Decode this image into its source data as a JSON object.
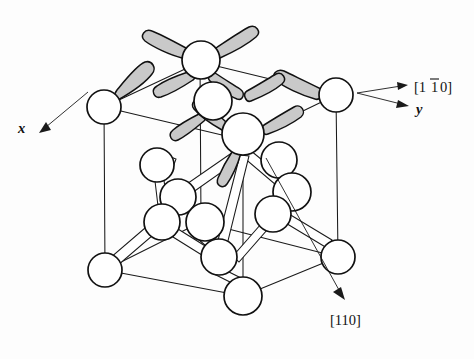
{
  "figure": {
    "kind": "crystal-lattice-diagram",
    "background_color": "#fdfdfd",
    "atom_fill": "#ffffff",
    "atom_stroke": "#111111",
    "lobe_fill": "#c9c9c9",
    "lobe_stroke": "#111111",
    "line_color": "#1a1a1a"
  },
  "labels": {
    "direction_upper": {
      "text_before_bar": "[1",
      "text_barred": "1",
      "text_after_bar": "0]",
      "full": "[110]",
      "has_overbar_on_second_digit": true
    },
    "axis_y": "y",
    "axis_x": "x",
    "direction_lower": "[110]"
  },
  "annotations": [
    {
      "name": "arrow-1bar10",
      "label": "[110]",
      "direction": "right",
      "from": [
        358,
        93
      ],
      "to": [
        408,
        86
      ]
    },
    {
      "name": "arrow-y",
      "label": "y",
      "direction": "right-down",
      "from": [
        358,
        93
      ],
      "to": [
        408,
        103
      ]
    },
    {
      "name": "arrow-x",
      "label": "x",
      "direction": "left-down",
      "from": [
        88,
        92
      ],
      "to": [
        40,
        128
      ]
    },
    {
      "name": "arrow-110",
      "label": "[110]",
      "direction": "right-down",
      "from": [
        268,
        160
      ],
      "to": [
        345,
        297
      ]
    }
  ],
  "cube": {
    "top_back_left": [
      104,
      107
    ],
    "top_back_right": [
      336,
      95
    ],
    "top_front_left": [
      200,
      62
    ],
    "top_front_right": [
      243,
      140
    ],
    "bottom_back_left": [
      105,
      270
    ],
    "bottom_back_right": [
      338,
      257
    ],
    "bottom_front_mid": [
      243,
      295
    ],
    "bottom_front_left": [
      219,
      267
    ]
  },
  "atoms": [
    {
      "id": "corner-top-back-left",
      "cx": 104,
      "cy": 107,
      "r": 17,
      "lobes": 1
    },
    {
      "id": "corner-top-back-right",
      "cx": 336,
      "cy": 95,
      "r": 17,
      "lobes": 1
    },
    {
      "id": "top-face-back",
      "cx": 201,
      "cy": 60,
      "r": 19,
      "lobes": 4
    },
    {
      "id": "top-face-mid",
      "cx": 213,
      "cy": 101,
      "r": 19,
      "lobes": 2
    },
    {
      "id": "top-face-front",
      "cx": 243,
      "cy": 134,
      "r": 21,
      "lobes": 3
    },
    {
      "id": "inner-left-upper",
      "cx": 157,
      "cy": 165,
      "r": 17,
      "lobes": 0
    },
    {
      "id": "inner-left-mid",
      "cx": 178,
      "cy": 197,
      "r": 18,
      "lobes": 0
    },
    {
      "id": "inner-left-lower",
      "cx": 162,
      "cy": 222,
      "r": 18,
      "lobes": 0
    },
    {
      "id": "inner-center",
      "cx": 205,
      "cy": 222,
      "r": 19,
      "lobes": 0
    },
    {
      "id": "inner-center-low",
      "cx": 219,
      "cy": 257,
      "r": 18,
      "lobes": 0
    },
    {
      "id": "inner-right-upper",
      "cx": 279,
      "cy": 160,
      "r": 18,
      "lobes": 0
    },
    {
      "id": "inner-right-mid",
      "cx": 292,
      "cy": 192,
      "r": 19,
      "lobes": 0
    },
    {
      "id": "inner-right-low",
      "cx": 273,
      "cy": 214,
      "r": 18,
      "lobes": 0
    },
    {
      "id": "corner-bottom-back-left",
      "cx": 105,
      "cy": 270,
      "r": 17,
      "lobes": 0
    },
    {
      "id": "corner-bottom-back-right",
      "cx": 338,
      "cy": 257,
      "r": 17,
      "lobes": 0
    },
    {
      "id": "corner-bottom-front",
      "cx": 243,
      "cy": 296,
      "r": 19,
      "lobes": 0
    }
  ],
  "lobe_count_total": 11
}
